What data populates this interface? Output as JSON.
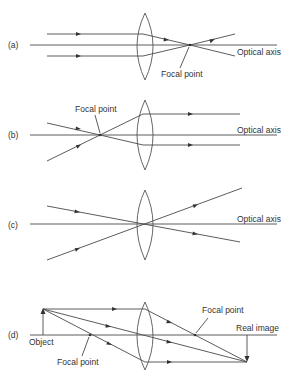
{
  "colors": {
    "line": "#4a4a4a",
    "text": "#333333",
    "background": "#ffffff"
  },
  "panels": [
    {
      "id": "a",
      "label": "(a)",
      "axis_label": "Optical axis",
      "focal_label": "Focal point",
      "description": "Parallel rays converge through the focal point"
    },
    {
      "id": "b",
      "label": "(b)",
      "axis_label": "Optical axis",
      "focal_label": "Focal point",
      "description": "Rays through the focal point emerge parallel"
    },
    {
      "id": "c",
      "label": "(c)",
      "axis_label": "Optical axis",
      "description": "Rays through the lens center pass undeviated"
    },
    {
      "id": "d",
      "label": "(d)",
      "object_label": "Object",
      "image_label": "Real image",
      "focal_label_left": "Focal point",
      "focal_label_right": "Focal point",
      "description": "Image formation: real, inverted image"
    }
  ]
}
